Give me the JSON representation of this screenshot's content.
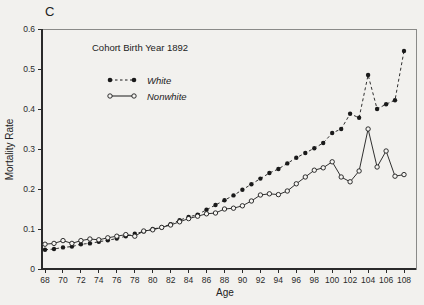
{
  "figure": {
    "panel_label": "C",
    "annotation": "Cohort Birth Year 1892",
    "xlabel": "Age",
    "ylabel": "Mortality Rate"
  },
  "chart_data": {
    "type": "line",
    "title": "Cohort Birth Year 1892",
    "panel_label": "C",
    "xlabel": "Age",
    "ylabel": "Mortality Rate",
    "xlim": [
      67.6,
      109.3
    ],
    "ylim": [
      0,
      0.6
    ],
    "x_ticks": [
      68,
      70,
      72,
      74,
      76,
      78,
      80,
      82,
      84,
      86,
      88,
      90,
      92,
      94,
      96,
      98,
      100,
      102,
      104,
      106,
      108
    ],
    "y_ticks": [
      0,
      0.1,
      0.2,
      0.3,
      0.4,
      0.5,
      0.6
    ],
    "y_tick_labels": [
      "0",
      "0.1",
      "0.2",
      "0.3",
      "0.4",
      "0.5",
      "0.6"
    ],
    "grid": false,
    "legend_position": "upper-left-inside",
    "x": [
      68,
      69,
      70,
      71,
      72,
      73,
      74,
      75,
      76,
      77,
      78,
      79,
      80,
      81,
      82,
      83,
      84,
      85,
      86,
      87,
      88,
      89,
      90,
      91,
      92,
      93,
      94,
      95,
      96,
      97,
      98,
      99,
      100,
      101,
      102,
      103,
      104,
      105,
      106,
      107,
      108
    ],
    "series": [
      {
        "name": "White",
        "marker": "filled-circle",
        "line_style": "dashed",
        "color": "#1a1a1a",
        "values": [
          0.048,
          0.05,
          0.054,
          0.056,
          0.062,
          0.064,
          0.068,
          0.072,
          0.076,
          0.082,
          0.088,
          0.094,
          0.1,
          0.104,
          0.112,
          0.122,
          0.13,
          0.136,
          0.148,
          0.16,
          0.172,
          0.184,
          0.198,
          0.212,
          0.226,
          0.24,
          0.25,
          0.264,
          0.278,
          0.29,
          0.302,
          0.315,
          0.34,
          0.35,
          0.388,
          0.378,
          0.485,
          0.4,
          0.412,
          0.422,
          0.545
        ]
      },
      {
        "name": "Nonwhite",
        "marker": "open-circle",
        "line_style": "solid",
        "color": "#1a1a1a",
        "values": [
          0.062,
          0.064,
          0.071,
          0.064,
          0.071,
          0.075,
          0.073,
          0.078,
          0.082,
          0.086,
          0.082,
          0.095,
          0.098,
          0.104,
          0.11,
          0.118,
          0.126,
          0.132,
          0.138,
          0.14,
          0.15,
          0.152,
          0.158,
          0.17,
          0.185,
          0.188,
          0.186,
          0.195,
          0.213,
          0.23,
          0.247,
          0.253,
          0.268,
          0.23,
          0.218,
          0.245,
          0.35,
          0.255,
          0.295,
          0.232,
          0.236
        ]
      }
    ],
    "colors": {
      "line": "#1a1a1a",
      "background": "#f2f1ee",
      "frame": "#8a8a88",
      "axis": "#2a2a2a",
      "marker_open_fill": "#f6f5f2"
    }
  }
}
